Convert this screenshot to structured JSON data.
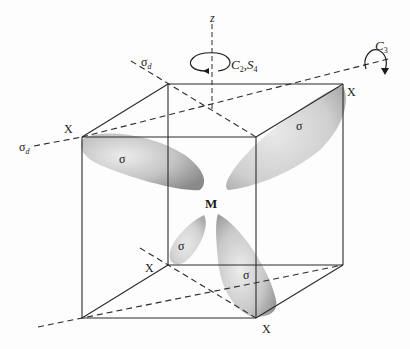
{
  "diagram": {
    "center_label": "M",
    "ligand_labels": [
      "X",
      "X",
      "X",
      "X"
    ],
    "lobe_labels": [
      "σ",
      "σ",
      "σ",
      "σ"
    ],
    "axis_label": "z",
    "rotation_labels": {
      "c2_s4": {
        "main1": "C",
        "sub1": "2",
        "sep": ",",
        "main2": "S",
        "sub2": "4"
      },
      "c3": {
        "main": "C",
        "sub": "3"
      }
    },
    "mirror_labels": [
      {
        "main": "σ",
        "sub": "d"
      },
      {
        "main": "σ",
        "sub": "d"
      }
    ],
    "colors": {
      "line": "#2b2b2b",
      "lobe_light": "#e6e6e6",
      "lobe_dark": "#8c8c8c",
      "background": "#fdfdfd"
    }
  }
}
